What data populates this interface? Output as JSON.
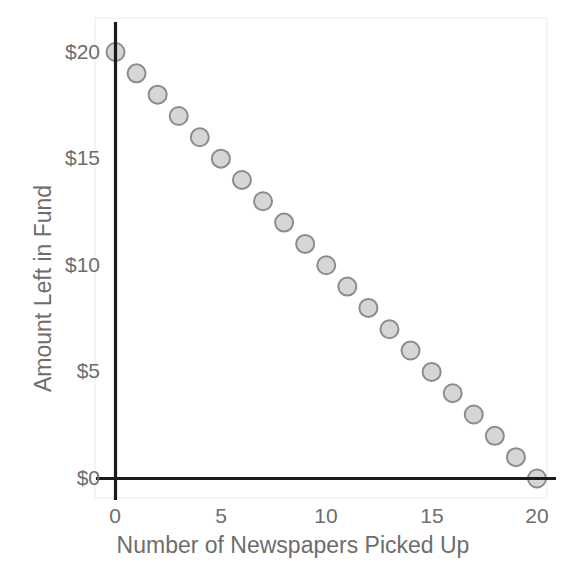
{
  "chart_data": {
    "type": "scatter",
    "title": "",
    "subtitle": "",
    "xlabel": "Number of Newspapers Picked Up",
    "ylabel": "Amount Left in Fund",
    "xlim": [
      0,
      20
    ],
    "ylim": [
      0,
      20
    ],
    "grid": false,
    "legend": null,
    "x_ticks": [
      0,
      5,
      10,
      15,
      20
    ],
    "x_tick_labels": [
      "0",
      "5",
      "10",
      "15",
      "20"
    ],
    "y_ticks": [
      0,
      5,
      10,
      15,
      20
    ],
    "y_tick_labels": [
      "$0",
      "$5",
      "$10",
      "$15",
      "$20"
    ],
    "series": [
      {
        "name": "Amount Left in Fund",
        "marker": "circle",
        "marker_fill": "#d6d6d6",
        "marker_stroke": "#8c8c8c",
        "marker_size": 18,
        "x": [
          0,
          1,
          2,
          3,
          4,
          5,
          6,
          7,
          8,
          9,
          10,
          11,
          12,
          13,
          14,
          15,
          16,
          17,
          18,
          19,
          20
        ],
        "values": [
          20,
          19,
          18,
          17,
          16,
          15,
          14,
          13,
          12,
          11,
          10,
          9,
          8,
          7,
          6,
          5,
          4,
          3,
          2,
          1,
          0
        ]
      }
    ],
    "colors": {
      "axis": "#1a1a1a",
      "text": "#6d6d6d",
      "marker_fill": "#d6d6d6",
      "marker_stroke": "#8c8c8c",
      "background": "#ffffff",
      "plot_border": "#f2f2f2"
    }
  },
  "axes": {
    "x_title": "Number of Newspapers Picked Up",
    "y_title": "Amount Left in Fund"
  },
  "x_tick_labels": [
    "0",
    "5",
    "10",
    "15",
    "20"
  ],
  "y_tick_labels": [
    "$0",
    "$5",
    "$10",
    "$15",
    "$20"
  ]
}
